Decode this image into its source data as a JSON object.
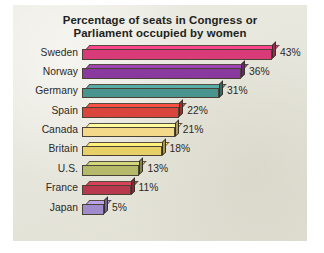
{
  "panel": {
    "background_color": "#e6e5da"
  },
  "chart_data": {
    "type": "bar",
    "orientation": "horizontal",
    "title": "Percentage of seats in Congress or Parliament occupied by women",
    "title_lines": [
      "Percentage of seats in Congress or",
      "Parliament occupied by women"
    ],
    "xlabel": "",
    "ylabel": "",
    "xlim": [
      0,
      45
    ],
    "grid": false,
    "legend": false,
    "unit": "%",
    "categories": [
      "Sweden",
      "Norway",
      "Germany",
      "Spain",
      "Canada",
      "Britain",
      "U.S.",
      "France",
      "Japan"
    ],
    "values": [
      43,
      36,
      31,
      22,
      21,
      18,
      13,
      11,
      5
    ],
    "value_labels": [
      "43%",
      "36%",
      "31%",
      "22%",
      "21%",
      "18%",
      "13%",
      "11%",
      "5%"
    ],
    "colors": [
      "#d93a78",
      "#8a3a9e",
      "#4a9490",
      "#d9453c",
      "#f5d98a",
      "#e8d068",
      "#b5b96a",
      "#b8394d",
      "#a08ccc"
    ],
    "bars": [
      {
        "label": "Sweden",
        "value": 43,
        "value_label": "43%",
        "color": "#d93a78"
      },
      {
        "label": "Norway",
        "value": 36,
        "value_label": "36%",
        "color": "#8a3a9e"
      },
      {
        "label": "Germany",
        "value": 31,
        "value_label": "31%",
        "color": "#4a9490"
      },
      {
        "label": "Spain",
        "value": 22,
        "value_label": "22%",
        "color": "#d9453c"
      },
      {
        "label": "Canada",
        "value": 21,
        "value_label": "21%",
        "color": "#f5d98a"
      },
      {
        "label": "Britain",
        "value": 18,
        "value_label": "18%",
        "color": "#e8d068"
      },
      {
        "label": "U.S.",
        "value": 13,
        "value_label": "13%",
        "color": "#b5b96a"
      },
      {
        "label": "France",
        "value": 11,
        "value_label": "11%",
        "color": "#b8394d"
      },
      {
        "label": "Japan",
        "value": 5,
        "value_label": "5%",
        "color": "#a08ccc"
      }
    ]
  }
}
